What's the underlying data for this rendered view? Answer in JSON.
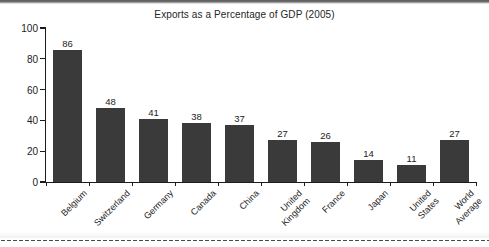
{
  "page": {
    "background_color": "#ffffff",
    "top_band_color": "#5d5d5d",
    "dotted_rule_color": "#4a4a4a"
  },
  "chart_data": {
    "type": "bar",
    "title": "Exports as a Percentage of GDP (2005)",
    "xlabel": "",
    "ylabel": "",
    "ylim": [
      0,
      100
    ],
    "yticks": [
      0,
      20,
      40,
      60,
      80,
      100
    ],
    "grid": false,
    "legend": null,
    "bar_color": "#3a3a3a",
    "axis_color": "#1c1c1c",
    "value_labels_shown": true,
    "categories": [
      "Belgium",
      "Switzerland",
      "Germany",
      "Canada",
      "China",
      "United Kingdom",
      "France",
      "Japan",
      "United States",
      "World Average"
    ],
    "category_label_lines": [
      [
        "Belgium"
      ],
      [
        "Switzerland"
      ],
      [
        "Germany"
      ],
      [
        "Canada"
      ],
      [
        "China"
      ],
      [
        "United",
        "Kingdom"
      ],
      [
        "France"
      ],
      [
        "Japan"
      ],
      [
        "United",
        "States"
      ],
      [
        "World",
        "Average"
      ]
    ],
    "values": [
      86,
      48,
      41,
      38,
      37,
      27,
      26,
      14,
      11,
      27
    ]
  }
}
